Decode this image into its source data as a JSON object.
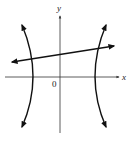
{
  "diagram": {
    "axes": {
      "x_label": "x",
      "y_label": "y",
      "origin_label": "0"
    },
    "curves": [
      {
        "name": "hyperbola-left-branch",
        "type": "hyperbola-branch",
        "arrows": "both-ends"
      },
      {
        "name": "hyperbola-right-branch",
        "type": "hyperbola-branch",
        "arrows": "both-ends"
      },
      {
        "name": "line",
        "type": "line",
        "slope": "positive",
        "arrows": "both-ends",
        "intersections": 2
      }
    ],
    "colors": {
      "stroke": "#111111",
      "axis": "#333333",
      "background": "#ffffff"
    }
  }
}
